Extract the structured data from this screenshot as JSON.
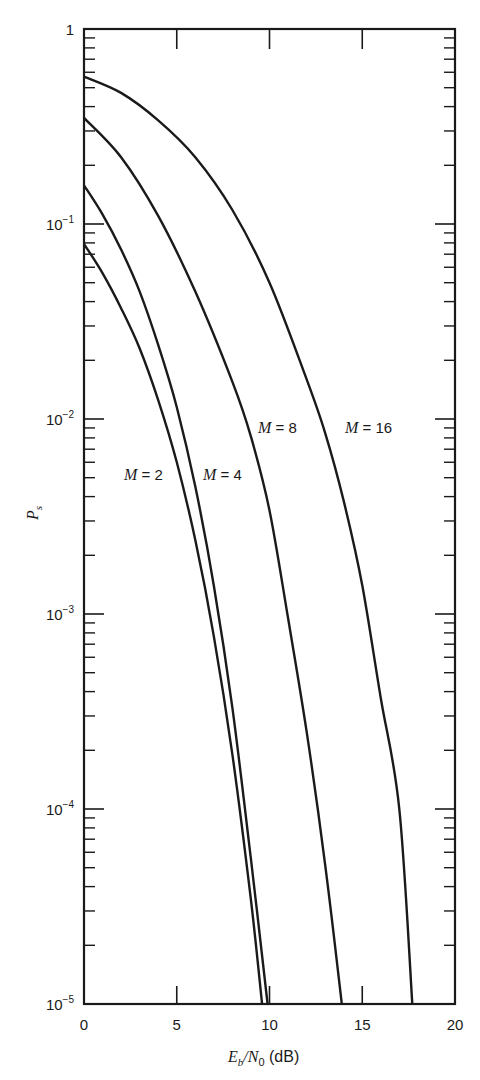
{
  "chart_data": {
    "type": "line",
    "title": "",
    "xlabel": "E_b/N_0 (dB)",
    "ylabel": "P_s",
    "xlim": [
      0,
      20
    ],
    "ylim": [
      1e-05,
      1
    ],
    "yscale": "log",
    "grid": false,
    "legend": "inline labels",
    "x_ticks": [
      0,
      5,
      10,
      15,
      20
    ],
    "y_ticks": [
      {
        "value": 1,
        "base": "1",
        "exp": ""
      },
      {
        "value": 0.1,
        "base": "10",
        "exp": "−1"
      },
      {
        "value": 0.01,
        "base": "10",
        "exp": "−2"
      },
      {
        "value": 0.001,
        "base": "10",
        "exp": "−3"
      },
      {
        "value": 0.0001,
        "base": "10",
        "exp": "−4"
      },
      {
        "value": 1e-05,
        "base": "10",
        "exp": "−5"
      }
    ],
    "series": [
      {
        "name": "M = 2",
        "label": "M = 2",
        "label_pos": [
          124,
          480
        ],
        "points": [
          [
            0,
            0.079
          ],
          [
            1,
            0.056
          ],
          [
            2,
            0.037
          ],
          [
            3,
            0.023
          ],
          [
            4,
            0.0125
          ],
          [
            5,
            0.006
          ],
          [
            6,
            0.0024
          ],
          [
            7,
            0.00077
          ],
          [
            8,
            0.00019
          ],
          [
            9,
            3.4e-05
          ],
          [
            9.6,
            1e-05
          ]
        ]
      },
      {
        "name": "M = 4",
        "label": "M = 4",
        "label_pos": [
          203,
          480
        ],
        "points": [
          [
            0,
            0.158
          ],
          [
            1,
            0.112
          ],
          [
            2,
            0.074
          ],
          [
            3,
            0.045
          ],
          [
            4,
            0.024
          ],
          [
            5,
            0.0115
          ],
          [
            6,
            0.0045
          ],
          [
            7,
            0.0014
          ],
          [
            8,
            0.00033
          ],
          [
            9,
            5.5e-05
          ],
          [
            9.9,
            1e-05
          ]
        ]
      },
      {
        "name": "M = 8",
        "label": "M = 8",
        "label_pos": [
          258,
          433
        ],
        "points": [
          [
            0,
            0.35
          ],
          [
            2,
            0.22
          ],
          [
            4,
            0.11
          ],
          [
            6,
            0.045
          ],
          [
            8,
            0.0155
          ],
          [
            9,
            0.0081
          ],
          [
            10,
            0.0034
          ],
          [
            11,
            0.00095
          ],
          [
            12,
            0.00025
          ],
          [
            13,
            5.2e-05
          ],
          [
            13.9,
            1e-05
          ]
        ]
      },
      {
        "name": "M = 16",
        "label": "M = 16",
        "label_pos": [
          345,
          433
        ],
        "points": [
          [
            0,
            0.57
          ],
          [
            2,
            0.47
          ],
          [
            4,
            0.34
          ],
          [
            6,
            0.22
          ],
          [
            8,
            0.118
          ],
          [
            10,
            0.05
          ],
          [
            12,
            0.016
          ],
          [
            13,
            0.0085
          ],
          [
            14,
            0.0038
          ],
          [
            15,
            0.0014
          ],
          [
            16,
            0.00037
          ],
          [
            17,
            0.0001
          ],
          [
            17.7,
            1e-05
          ]
        ]
      }
    ]
  },
  "labels": {
    "x_axis": {
      "E": "E",
      "b": "b",
      "slash": "/",
      "N": "N",
      "zero": "0",
      "unit": " (dB)"
    },
    "y_axis": {
      "P": "P",
      "s": "s"
    }
  },
  "colors": {
    "ink": "#1a1a1a",
    "background": "#ffffff"
  }
}
